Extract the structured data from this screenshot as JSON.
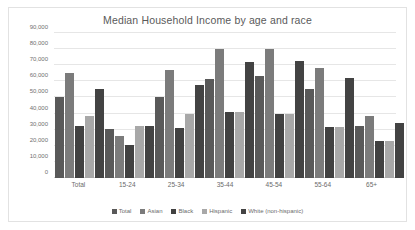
{
  "chart_data": {
    "type": "bar",
    "title": "Median Household Income by age and race",
    "xlabel": "",
    "ylabel": "",
    "ylim": [
      0,
      90000
    ],
    "grid": true,
    "legend_position": "bottom",
    "y_ticks": [
      "0",
      "10,000",
      "20,000",
      "30,000",
      "40,000",
      "50,000",
      "60,000",
      "70,000",
      "80,000",
      "90,000"
    ],
    "y_tick_values": [
      0,
      10000,
      20000,
      30000,
      40000,
      50000,
      60000,
      70000,
      80000,
      90000
    ],
    "categories": [
      "Total",
      "15-24",
      "25-34",
      "35-44",
      "45-54",
      "55-64",
      "65+"
    ],
    "series": [
      {
        "name": "Total",
        "color": "#595959",
        "values": [
          50000,
          30200,
          50500,
          61500,
          63500,
          55500,
          32200
        ]
      },
      {
        "name": "Asian",
        "color": "#7b7b7b",
        "values": [
          65000,
          26000,
          67000,
          80000,
          80000,
          68000,
          38200
        ]
      },
      {
        "name": "Black",
        "color": "#414141",
        "values": [
          32000,
          20200,
          31000,
          41000,
          39500,
          31500,
          22800
        ]
      },
      {
        "name": "Hispanic",
        "color": "#a8a8a8",
        "values": [
          38500,
          32200,
          39500,
          41200,
          39500,
          31500,
          23000
        ]
      },
      {
        "name": "White (non-hispanic)",
        "color": "#434343",
        "values": [
          55500,
          32200,
          57500,
          72000,
          72500,
          62000,
          34200
        ]
      }
    ]
  }
}
